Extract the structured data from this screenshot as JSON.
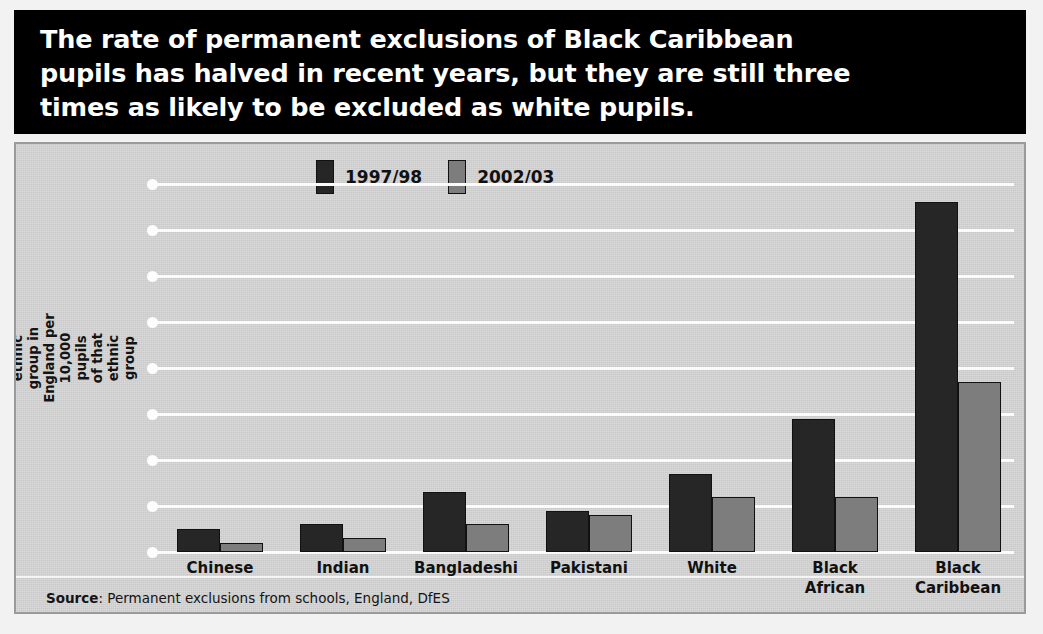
{
  "title": "The rate of permanent exclusions of Black Caribbean\npupils has halved in recent years, but they are still three\ntimes as likely to be excluded as white pupils.",
  "source": {
    "prefix": "Source",
    "separator": ": ",
    "text": "Permanent exclusions from schools, England, DfES"
  },
  "colors": {
    "series_1": "#262626",
    "series_2": "#7d7d7d",
    "panel_background": "#d2d2d2",
    "banner_background": "#000000",
    "gridline": "#fbfbfb"
  },
  "chart_data": {
    "type": "bar",
    "title": "The rate of permanent exclusions of Black Caribbean pupils has halved in recent years, but they are still three times as likely to be excluded as white pupils.",
    "xlabel": "",
    "ylabel": "Pupils permanently excluded by\nethnic group in England per 10,000 pupils\nof that ethnic group",
    "categories": [
      "Chinese",
      "Indian",
      "Bangladeshi",
      "Pakistani",
      "White",
      "Black\nAfrican",
      "Black\nCaribbean"
    ],
    "series": [
      {
        "name": "1997/98",
        "values": [
          5,
          6,
          13,
          9,
          17,
          29,
          76
        ]
      },
      {
        "name": "2002/03",
        "values": [
          2,
          3,
          6,
          8,
          12,
          12,
          37
        ]
      }
    ],
    "ylim": [
      0,
      80
    ],
    "yticks": [
      0,
      10,
      20,
      30,
      40,
      50,
      60,
      70,
      80
    ],
    "ytick_labels": [
      "0",
      "10",
      "20",
      "30",
      "40",
      "50",
      "60",
      "70",
      "80"
    ],
    "grid": true,
    "legend_position": "top-center"
  }
}
